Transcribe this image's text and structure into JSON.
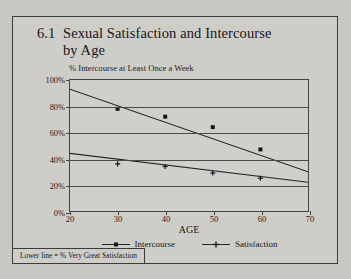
{
  "figure": {
    "title_number": "6.1",
    "title_line1": "Sexual Satisfaction and Intercourse",
    "title_line2": "by Age",
    "footnote": "Lower line = % Very Great Satisfaction"
  },
  "chart_data": {
    "type": "scatter",
    "subtitle": "% Intercourse at Least Once a Week",
    "xlabel": "AGE",
    "ylabel": "",
    "xlim": [
      20,
      70
    ],
    "ylim": [
      0,
      100
    ],
    "xticks": [
      20,
      30,
      40,
      50,
      60,
      70
    ],
    "xtick_labels": [
      "20",
      "30",
      "40",
      "50",
      "60",
      "70"
    ],
    "yticks": [
      0,
      20,
      40,
      60,
      80,
      100
    ],
    "ytick_labels": [
      "0%",
      "20%",
      "40%",
      "60%",
      "80%",
      "100%"
    ],
    "grid": true,
    "legend_position": "bottom",
    "series": [
      {
        "name": "Intercourse",
        "marker": "square",
        "x": [
          30,
          40,
          50,
          60
        ],
        "values": [
          78,
          72,
          64,
          47
        ],
        "trendline": {
          "x": [
            20,
            70
          ],
          "values": [
            93,
            30
          ]
        }
      },
      {
        "name": "Satisfaction",
        "marker": "plus",
        "x": [
          30,
          40,
          50,
          60
        ],
        "values": [
          36,
          34,
          29,
          25
        ],
        "trendline": {
          "x": [
            20,
            70
          ],
          "values": [
            44,
            22
          ]
        }
      }
    ],
    "annotations": [
      "Lower line = % Very Great Satisfaction"
    ]
  }
}
